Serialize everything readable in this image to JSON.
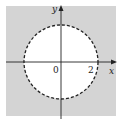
{
  "figure": {
    "region_color": "#d4d4d4",
    "circle_fill": "#ffffff",
    "circle_stroke": "#222222",
    "boundary_style": "dashed",
    "axis_color": "#222222"
  },
  "axes": {
    "x_label": "x",
    "y_label": "y",
    "origin_label": "0",
    "x_tick_label": "2"
  }
}
